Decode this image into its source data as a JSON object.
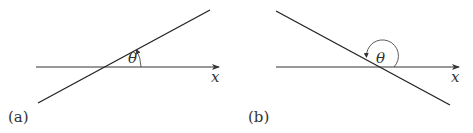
{
  "panels": [
    {
      "id": "a",
      "label": "(a)",
      "axis_label": "x",
      "angle_label": "θ",
      "line_slope": "positive",
      "angle_description": "acute angle measured counterclockwise from x-axis to line"
    },
    {
      "id": "b",
      "label": "(b)",
      "axis_label": "x",
      "angle_label": "θ",
      "line_slope": "negative",
      "angle_description": "obtuse angle measured counterclockwise from x-axis to line"
    }
  ]
}
